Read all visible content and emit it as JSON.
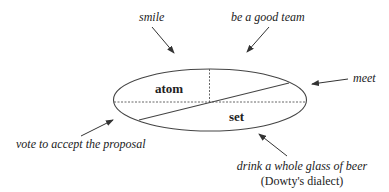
{
  "diagram": {
    "regions": {
      "upper_left": "atom",
      "lower_right": "set"
    },
    "labels": {
      "smile": "smile",
      "be_a_good_team": "be a good team",
      "meet": "meet",
      "vote": "vote to accept the proposal",
      "drink": "drink a whole glass of beer",
      "drink_note": "(Dowty's dialect)"
    },
    "colors": {
      "line": "#333333",
      "background": "#ffffff"
    }
  }
}
